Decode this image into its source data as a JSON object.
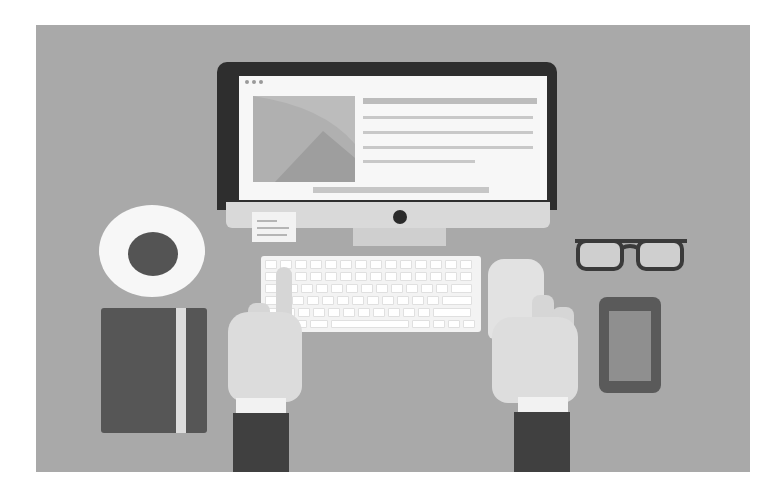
{
  "scene": {
    "description": "Flat illustration of a desk workspace viewed from above",
    "background_color": "#a9a9a9",
    "page_color": "#ffffff"
  },
  "monitor": {
    "window_dots": 3,
    "screen_text_lines": [
      {
        "role": "heading",
        "width": 174
      },
      {
        "role": "body",
        "width": 170
      },
      {
        "role": "body",
        "width": 170
      },
      {
        "role": "body",
        "width": 170
      },
      {
        "role": "body",
        "width": 112
      }
    ],
    "screen_bottom_bar": true,
    "power_button": true
  },
  "sticky_note": {
    "lines": 3
  },
  "keyboard": {
    "rows": [
      {
        "keys": 14
      },
      {
        "keys": 14
      },
      {
        "keys": 13
      },
      {
        "keys": 12
      },
      {
        "keys": 11
      }
    ]
  },
  "objects": {
    "coffee_cup": "coffee-cup-top-view",
    "notebook": "notebook-with-strap",
    "glasses": "eyeglasses",
    "phone": "smartphone",
    "left_hand": "left-hand-typing",
    "right_hand": "right-hand-typing"
  },
  "colors": {
    "bezel": "#2e2e2e",
    "screen": "#f7f7f7",
    "sleeve": "#404040",
    "hand": "#dcdcdc",
    "notebook": "#565656",
    "coffee": "#545454"
  }
}
